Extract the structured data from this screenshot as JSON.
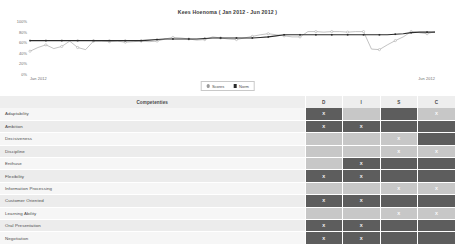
{
  "chart": {
    "title": "Kees Hoenoma ( Jan 2012 - Jun 2012 )",
    "legend": [
      {
        "label": "Scores",
        "color": "#9a9a9a",
        "marker": "circle"
      },
      {
        "label": "Norm",
        "color": "#2b2b2b",
        "marker": "square"
      }
    ]
  },
  "table": {
    "headers": {
      "name": "Competenties",
      "d": "D",
      "i": "I",
      "s": "S",
      "c": "C"
    },
    "rows": [
      {
        "name": "Adaptability",
        "d": "X",
        "i": "",
        "s": "",
        "c": "X",
        "d_shade": "dark",
        "i_shade": "light",
        "s_shade": "dark",
        "c_shade": "light"
      },
      {
        "name": "Ambition",
        "d": "X",
        "i": "X",
        "s": "",
        "c": "",
        "d_shade": "dark",
        "i_shade": "dark",
        "s_shade": "dark",
        "c_shade": "dark"
      },
      {
        "name": "Decisiveness",
        "d": "",
        "i": "",
        "s": "X",
        "c": "",
        "d_shade": "light",
        "i_shade": "light",
        "s_shade": "light",
        "c_shade": "dark"
      },
      {
        "name": "Discipline",
        "d": "",
        "i": "",
        "s": "X",
        "c": "X",
        "d_shade": "light",
        "i_shade": "light",
        "s_shade": "light",
        "c_shade": "light"
      },
      {
        "name": "Enthuse",
        "d": "",
        "i": "X",
        "s": "",
        "c": "",
        "d_shade": "light",
        "i_shade": "dark",
        "s_shade": "dark",
        "c_shade": "dark"
      },
      {
        "name": "Flexibility",
        "d": "X",
        "i": "X",
        "s": "",
        "c": "",
        "d_shade": "dark",
        "i_shade": "dark",
        "s_shade": "dark",
        "c_shade": "dark"
      },
      {
        "name": "Information Processing",
        "d": "",
        "i": "",
        "s": "X",
        "c": "X",
        "d_shade": "light",
        "i_shade": "light",
        "s_shade": "light",
        "c_shade": "light"
      },
      {
        "name": "Customer Oriented",
        "d": "X",
        "i": "X",
        "s": "",
        "c": "",
        "d_shade": "dark",
        "i_shade": "dark",
        "s_shade": "dark",
        "c_shade": "dark"
      },
      {
        "name": "Learning Ability",
        "d": "",
        "i": "",
        "s": "X",
        "c": "X",
        "d_shade": "light",
        "i_shade": "light",
        "s_shade": "light",
        "c_shade": "light"
      },
      {
        "name": "Oral Presentation",
        "d": "X",
        "i": "X",
        "s": "",
        "c": "",
        "d_shade": "dark",
        "i_shade": "dark",
        "s_shade": "dark",
        "c_shade": "dark"
      },
      {
        "name": "Negotiation",
        "d": "X",
        "i": "X",
        "s": "",
        "c": "",
        "d_shade": "dark",
        "i_shade": "dark",
        "s_shade": "dark",
        "c_shade": "dark"
      }
    ]
  },
  "chart_data": {
    "type": "line",
    "title": "Kees Hoenoma ( Jan 2012 - Jun 2012 )",
    "xlabel": "",
    "ylabel": "",
    "ylim": [
      0,
      100
    ],
    "yticks": [
      0,
      20,
      40,
      60,
      80,
      100
    ],
    "ytick_labels": [
      "0%",
      "20%",
      "40%",
      "60%",
      "80%",
      "100%"
    ],
    "xtick_labels": [
      "Jan 2012",
      "Jun 2012"
    ],
    "grid": false,
    "legend_position": "bottom-center",
    "x": [
      1,
      2,
      3,
      4,
      5,
      6,
      7,
      8,
      9,
      10,
      11,
      12,
      13,
      14,
      15,
      16,
      17,
      18,
      19,
      20,
      21,
      22,
      23,
      24,
      25,
      26,
      27,
      28,
      29,
      30,
      31,
      32,
      33,
      34,
      35,
      36,
      37,
      38,
      39,
      40,
      41,
      42,
      43,
      44,
      45,
      46,
      47,
      48,
      49,
      50,
      51,
      52
    ],
    "series": [
      {
        "name": "Scores",
        "color": "#9a9a9a",
        "marker": "circle",
        "values": [
          43,
          50,
          55,
          48,
          52,
          62,
          50,
          46,
          62,
          62,
          61,
          62,
          60,
          61,
          62,
          61,
          62,
          66,
          69,
          68,
          66,
          64,
          65,
          70,
          68,
          66,
          65,
          68,
          71,
          74,
          76,
          74,
          72,
          70,
          70,
          80,
          80,
          79,
          80,
          80,
          79,
          80,
          80,
          47,
          46,
          55,
          63,
          70,
          80,
          78,
          76,
          80
        ]
      },
      {
        "name": "Norm",
        "color": "#2b2b2b",
        "marker": "square",
        "values": [
          63,
          63,
          63,
          63,
          63,
          63,
          63,
          63,
          63,
          63,
          63,
          63,
          63,
          63,
          63,
          64,
          65,
          66,
          66,
          66,
          66,
          66,
          67,
          68,
          68,
          68,
          68,
          68,
          68,
          69,
          70,
          72,
          74,
          74,
          74,
          74,
          74,
          74,
          74,
          74,
          74,
          74,
          74,
          74,
          74,
          74,
          75,
          76,
          78,
          79,
          79,
          79
        ]
      }
    ]
  }
}
